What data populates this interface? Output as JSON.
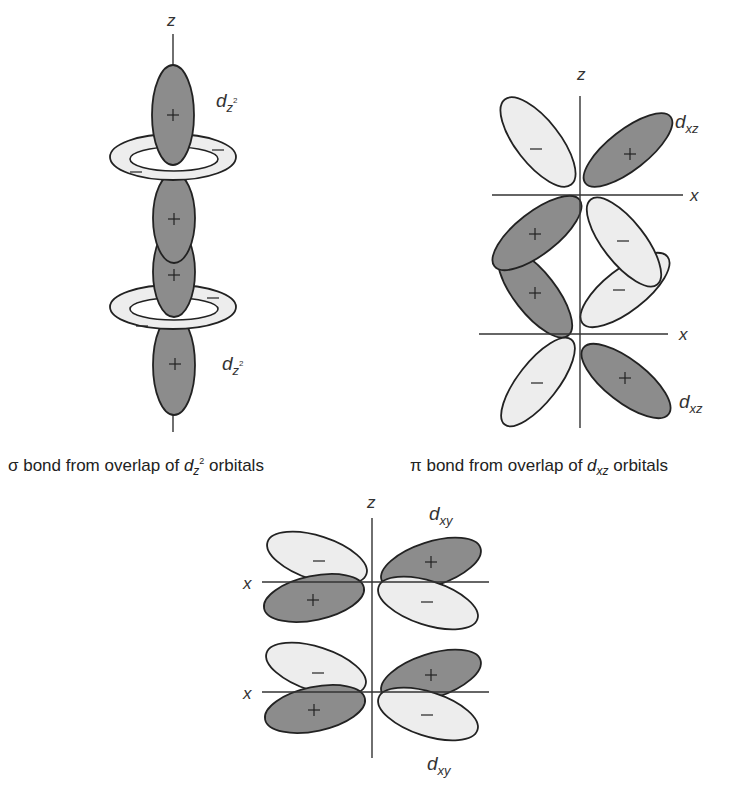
{
  "colors": {
    "positive_fill": "#8c8c8c",
    "negative_fill": "#ededed",
    "outline": "#222222",
    "axis": "#333333"
  },
  "sigma": {
    "axis_label": "z",
    "orbital_label_top": "d",
    "orbital_sub_top": "z",
    "orbital_sup_top": "2",
    "orbital_label_bottom": "d",
    "orbital_sub_bottom": "z",
    "orbital_sup_bottom": "2",
    "signs": {
      "lobe": "+",
      "ring": "−"
    },
    "caption": {
      "prefix": "σ bond from overlap of ",
      "orbital": "d",
      "sub": "z",
      "sup": "2",
      "suffix": " orbitals"
    }
  },
  "pi": {
    "axis_z": "z",
    "axis_x_top": "x",
    "axis_x_bottom": "x",
    "orbital_label_top": "d",
    "orbital_sub_top": "xz",
    "orbital_label_bottom": "d",
    "orbital_sub_bottom": "xz",
    "signs": {
      "pos": "+",
      "neg": "−"
    },
    "caption": {
      "prefix": "π bond from overlap of ",
      "orbital": "d",
      "sub": "xz",
      "suffix": " orbitals"
    }
  },
  "delta": {
    "axis_z": "z",
    "axis_x_top": "x",
    "axis_x_bottom": "x",
    "orbital_label_top": "d",
    "orbital_sub_top": "xy",
    "orbital_label_bottom": "d",
    "orbital_sub_bottom": "xy",
    "signs": {
      "pos": "+",
      "neg": "−"
    }
  }
}
